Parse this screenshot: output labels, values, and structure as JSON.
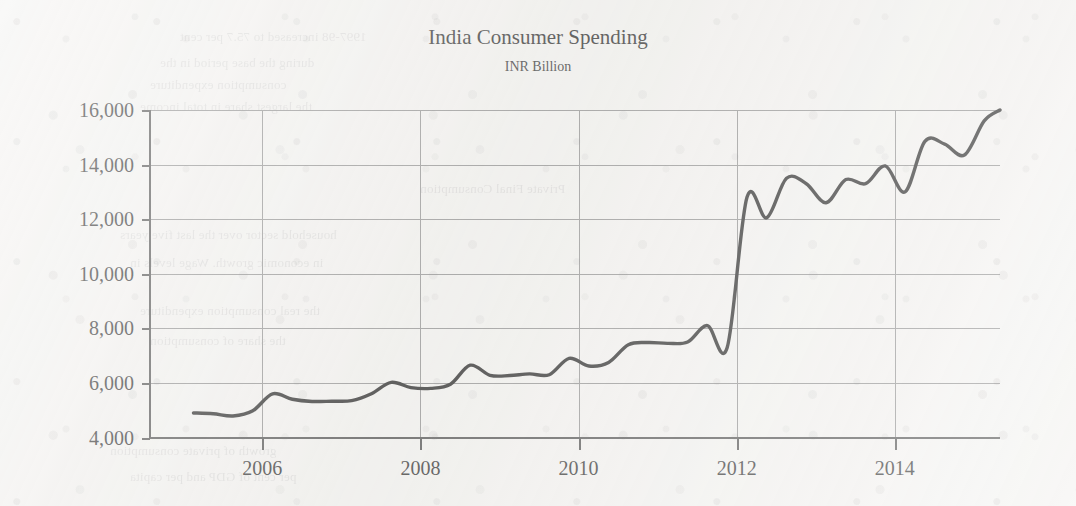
{
  "chart_data": {
    "type": "line",
    "title": "India Consumer Spending",
    "subtitle": "INR Billion",
    "xlabel": "",
    "ylabel": "",
    "ylim": [
      4000,
      16500
    ],
    "xlim": [
      2004.58,
      2015.33
    ],
    "grid": true,
    "legend": null,
    "y_ticks": [
      4000,
      6000,
      8000,
      10000,
      12000,
      14000,
      16000
    ],
    "y_tick_labels": [
      "4,000",
      "6,000",
      "8,000",
      "10,000",
      "12,000",
      "14,000",
      "16,000"
    ],
    "x_ticks": [
      2006,
      2008,
      2010,
      2012,
      2014
    ],
    "x_tick_labels": [
      "2006",
      "2008",
      "2010",
      "2012",
      "2014"
    ],
    "series": [
      {
        "name": "India Consumer Spending",
        "color": "#1f1f1f",
        "x": [
          2005.13,
          2005.38,
          2005.63,
          2005.88,
          2006.13,
          2006.38,
          2006.63,
          2006.88,
          2007.13,
          2007.38,
          2007.63,
          2007.88,
          2008.13,
          2008.38,
          2008.63,
          2008.88,
          2009.13,
          2009.38,
          2009.63,
          2009.88,
          2010.13,
          2010.38,
          2010.63,
          2010.88,
          2011.13,
          2011.38,
          2011.63,
          2011.88,
          2012.13,
          2012.38,
          2012.63,
          2012.88,
          2013.13,
          2013.38,
          2013.63,
          2013.88,
          2014.13,
          2014.38,
          2014.63,
          2014.88,
          2015.13,
          2015.33
        ],
        "values": [
          4900,
          4870,
          4790,
          4980,
          5600,
          5400,
          5320,
          5330,
          5350,
          5600,
          6020,
          5830,
          5800,
          5950,
          6650,
          6280,
          6270,
          6330,
          6300,
          6900,
          6620,
          6750,
          7400,
          7480,
          7450,
          7500,
          8100,
          7300,
          12800,
          12050,
          13500,
          13300,
          12600,
          13450,
          13300,
          13950,
          13000,
          14850,
          14750,
          14350,
          15600,
          16000
        ]
      }
    ]
  },
  "figure": {
    "background_color": "#f3f2f0",
    "line_color": "#1f1f1f",
    "grid_color": "#8e8e8e",
    "axis_color": "#4a4a4a",
    "text_color": "#2a2a2a"
  },
  "bleed_through": {
    "lines": [
      {
        "text": "1997-98 increased to 75.7 per cent",
        "x": 180,
        "y": 26
      },
      {
        "text": "during the base period in the",
        "x": 160,
        "y": 52
      },
      {
        "text": "consumption expenditure",
        "x": 150,
        "y": 74
      },
      {
        "text": "the largest share in total income",
        "x": 140,
        "y": 96
      },
      {
        "text": "Private Final Consumption",
        "x": 420,
        "y": 178
      },
      {
        "text": "household sector over the last five years",
        "x": 120,
        "y": 224
      },
      {
        "text": "in economic growth. Wage levels in",
        "x": 130,
        "y": 252
      },
      {
        "text": "the real consumption expenditure",
        "x": 140,
        "y": 300
      },
      {
        "text": "the share of consumption",
        "x": 150,
        "y": 330
      },
      {
        "text": "growth of private consumption",
        "x": 110,
        "y": 440
      },
      {
        "text": "per cent of GDP and per capita",
        "x": 130,
        "y": 466
      }
    ]
  }
}
